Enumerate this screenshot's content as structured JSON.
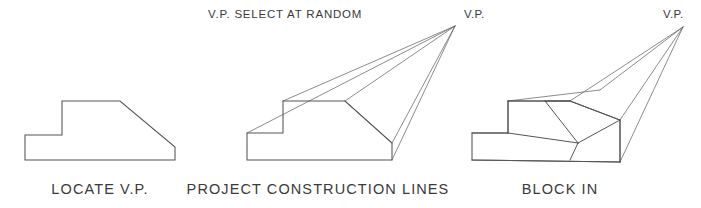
{
  "figure": {
    "background_color": "#ffffff",
    "line_color": "#555555",
    "construction_line_color": "#666666",
    "text_color": "#3a3a3a",
    "width": 701,
    "height": 208
  },
  "panels": [
    {
      "id": "locate-vp",
      "caption": "LOCATE V.P.",
      "caption_x": 100,
      "caption_y": 194,
      "profile_points": "25,135 25,160 175,160 175,147 120,101 62,101 62,135 25,135",
      "vp_label": null
    },
    {
      "id": "project-construction-lines",
      "caption": "PROJECT CONSTRUCTION LINES",
      "caption_x": 318,
      "caption_y": 194,
      "profile_points": "247,133 247,160 392,160 392,143 345,101 283,101 283,133 247,133",
      "vp_label": "V.P.",
      "vp_label_x": 464,
      "vp_label_y": 18,
      "vp_x": 455,
      "vp_y": 26,
      "note": "V.P.  SELECT AT RANDOM",
      "note_x": 208,
      "note_y": 18,
      "note_label": "V.P.",
      "note_text": "SELECT AT RANDOM",
      "construction_lines": [
        "247,133 455,26",
        "283,101 455,26",
        "345,101 455,26",
        "392,143 455,26",
        "392,160 455,26",
        "345,101 392,143"
      ]
    },
    {
      "id": "block-in",
      "caption": "BLOCK IN",
      "caption_x": 560,
      "caption_y": 194,
      "profile_points": "472,133 472,160 620,162 620,120 570,101 508,101 508,133 472,133",
      "vp_label": "V.P.",
      "vp_label_x": 663,
      "vp_label_y": 18,
      "vp_x": 683,
      "vp_y": 27,
      "construction_lines": [
        "570,101 683,27",
        "620,120 683,27",
        "620,162 683,27",
        "508,101 600,90",
        "600,90 683,27"
      ],
      "solid_edges": [
        "472,133 508,133",
        "508,133 508,101",
        "508,101 570,101",
        "570,101 620,120",
        "620,120 620,162",
        "472,160 620,162",
        "508,133 578,143",
        "578,143 620,120",
        "578,143 570,160",
        "545,101 578,143",
        "570,101 545,101"
      ]
    }
  ]
}
